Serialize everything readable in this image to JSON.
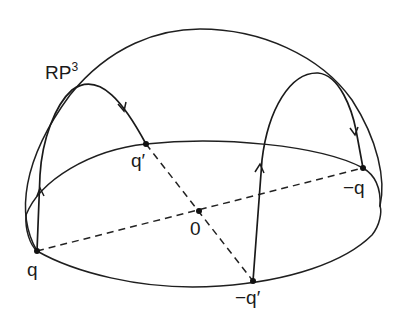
{
  "figure": {
    "space_label": "RP",
    "space_superscript": "3",
    "points": {
      "q": "q",
      "q_prime": "q′",
      "origin": "0",
      "neg_q": "−q",
      "neg_q_prime": "−q′"
    },
    "colors": {
      "ink": "#1a1a1a",
      "background": "#ffffff"
    }
  }
}
